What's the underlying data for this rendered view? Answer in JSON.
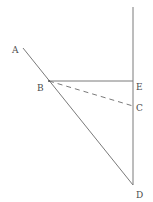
{
  "diagram": {
    "type": "geometry-figure",
    "line_color": "#7a7a7a",
    "label_color": "#4a4a4a",
    "points": {
      "A": {
        "label": "A",
        "x": 23,
        "y": 48
      },
      "B": {
        "label": "B",
        "x": 49,
        "y": 81
      },
      "C": {
        "label": "C",
        "x": 133,
        "y": 106
      },
      "D": {
        "label": "D",
        "x": 133,
        "y": 185
      },
      "E": {
        "label": "E",
        "x": 133,
        "y": 81
      },
      "top": {
        "x": 133,
        "y": 7
      }
    },
    "segments": [
      {
        "from": "A",
        "to": "D",
        "style": "solid"
      },
      {
        "from": "B",
        "to": "E",
        "style": "solid"
      },
      {
        "from": "B",
        "to": "C",
        "style": "dashed"
      },
      {
        "from": "top",
        "to": "D",
        "style": "solid"
      }
    ]
  }
}
